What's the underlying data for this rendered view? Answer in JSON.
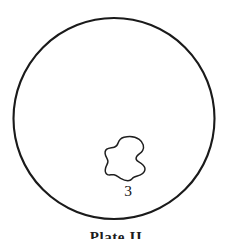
{
  "figure": {
    "caption": "Plate II",
    "background_color": "#ffffff",
    "ink_color": "#1a1a1a",
    "width": 232,
    "height": 239
  },
  "field_of_view": {
    "name": "microscope-field-circle",
    "center_x": 114,
    "center_y": 118.5,
    "radius": 100.5,
    "stroke_color": "#1a1a1a",
    "stroke_width": 2.1,
    "fill": "none"
  },
  "specimen": {
    "number_label": "3",
    "label_x": 128,
    "label_y": 196,
    "stroke_color": "#1f1f1f",
    "stroke_width": 1.5,
    "fill": "#ffffff",
    "outline_path": "M 124.0 137.2 C 129.6 135.8 135.4 136.6 139.2 139.4 C 143.4 142.5 144.6 147.2 142.6 150.6 C 141.0 153.3 137.9 154.4 136.6 156.6 C 135.4 158.7 136.6 160.6 138.8 161.9 C 141.6 163.6 144.4 165.4 144.9 168.2 C 145.4 171.2 143.2 173.6 140.4 174.9 C 138.0 176.0 135.4 176.1 133.6 177.4 C 131.9 178.6 131.4 180.2 129.2 180.6 C 126.4 181.1 123.2 179.9 120.6 178.4 C 118.3 177.0 116.4 175.2 114.0 174.8 C 111.6 174.4 109.2 175.6 107.4 174.6 C 105.4 173.5 104.9 170.6 105.6 168.0 C 106.2 165.6 107.8 163.8 107.9 161.6 C 108.0 159.3 106.4 157.6 105.6 155.4 C 104.8 153.2 105.0 150.6 106.8 149.2 C 108.8 147.6 111.9 148.0 114.2 147.2 C 116.4 146.5 117.6 144.8 118.2 142.8 C 118.9 140.6 120.2 138.2 124.0 137.2 Z"
  }
}
